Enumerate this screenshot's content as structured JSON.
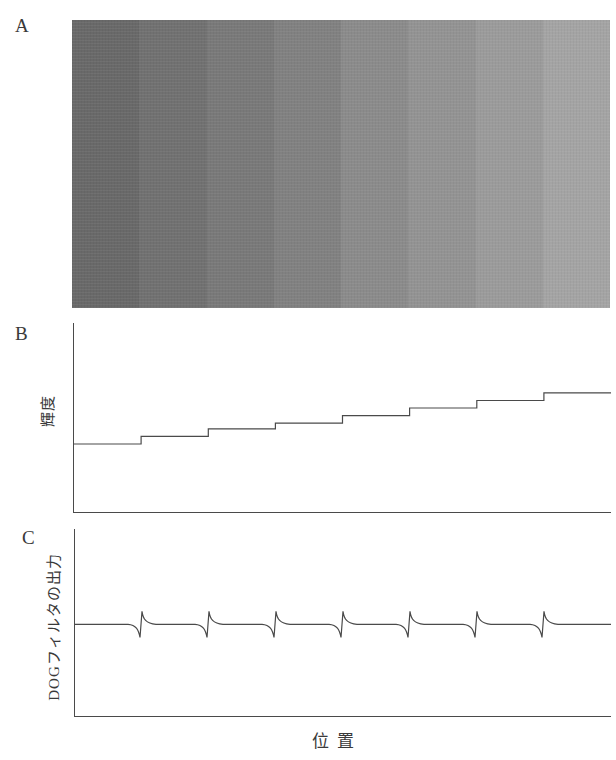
{
  "figure": {
    "background": "#ffffff",
    "line_color": "#4a4a4a",
    "xlabel": "位 置"
  },
  "panel_a": {
    "label": "A",
    "content": "staircase grayscale image, 8 vertical bands from dark to light",
    "band_colors": [
      "#696969",
      "#717171",
      "#797979",
      "#818181",
      "#8b8b8b",
      "#939393",
      "#9b9b9b",
      "#a4a4a4"
    ]
  },
  "panel_b": {
    "label": "B",
    "ylabel": "輝度"
  },
  "panel_c": {
    "label": "C",
    "ylabel": "DOGフィルタの出力"
  },
  "chart_data": [
    {
      "id": "luminance_profile",
      "type": "line",
      "title": "",
      "xlabel": "位 置",
      "ylabel": "輝度",
      "grid": false,
      "legend": false,
      "x_edges_frac": [
        0,
        0.125,
        0.25,
        0.375,
        0.5,
        0.625,
        0.75,
        0.875,
        1
      ],
      "step_levels_frac": [
        0.36,
        0.4,
        0.44,
        0.47,
        0.51,
        0.55,
        0.59,
        0.63
      ],
      "note": "ascending staircase: 8 flat luminance levels, one per gray band, step up at each band boundary"
    },
    {
      "id": "dog_filter_output",
      "type": "line",
      "title": "",
      "xlabel": "位 置",
      "ylabel": "DOGフィルタの出力",
      "grid": false,
      "legend": false,
      "baseline_frac": 0.49,
      "edge_positions_frac": [
        0.125,
        0.25,
        0.375,
        0.5,
        0.625,
        0.75,
        0.875
      ],
      "undershoot_frac": 0.07,
      "overshoot_frac": 0.07,
      "note": "flat zero response with a biphasic pulse (dip then sharp positive peak decaying back) at each luminance edge"
    }
  ]
}
